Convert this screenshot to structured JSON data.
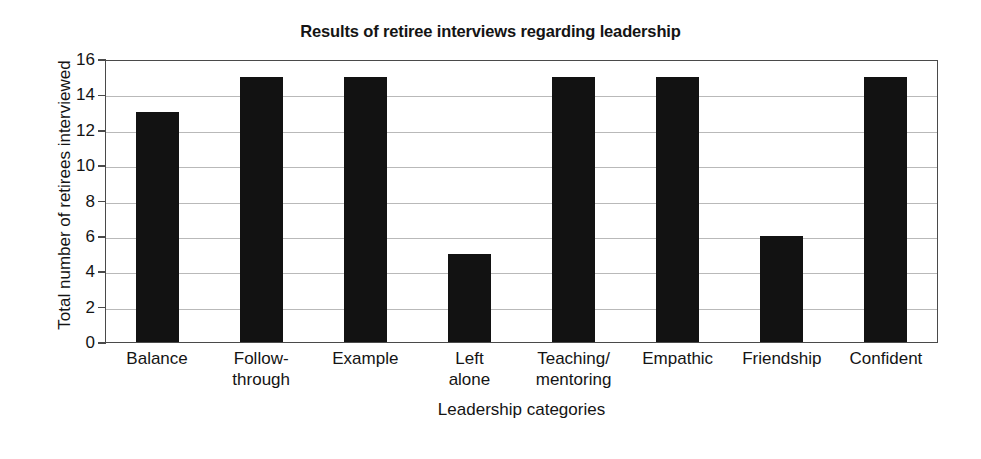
{
  "chart_data": {
    "type": "bar",
    "title": "Results of retiree interviews regarding leadership",
    "xlabel": "Leadership categories",
    "ylabel": "Total number of retirees interviewed",
    "categories": [
      "Balance",
      "Follow-through",
      "Example",
      "Left alone",
      "Teaching/mentoring",
      "Empathic",
      "Friendship",
      "Confident"
    ],
    "category_lines": [
      [
        "Balance"
      ],
      [
        "Follow-",
        "through"
      ],
      [
        "Example"
      ],
      [
        "Left",
        "alone"
      ],
      [
        "Teaching/",
        "mentoring"
      ],
      [
        "Empathic"
      ],
      [
        "Friendship"
      ],
      [
        "Confident"
      ]
    ],
    "values": [
      13,
      15,
      15,
      5,
      15,
      15,
      6,
      15
    ],
    "ylim": [
      0,
      16
    ],
    "yticks": [
      0,
      2,
      4,
      6,
      8,
      10,
      12,
      14,
      16
    ],
    "ytick_labels": [
      "0",
      "2",
      "4",
      "6",
      "8",
      "10",
      "12",
      "14",
      "16"
    ],
    "grid": true,
    "legend": false,
    "bar_color": "#121212",
    "grid_color": "#b9b9b9",
    "axis_color": "#4a4a4a",
    "background": "#ffffff"
  }
}
